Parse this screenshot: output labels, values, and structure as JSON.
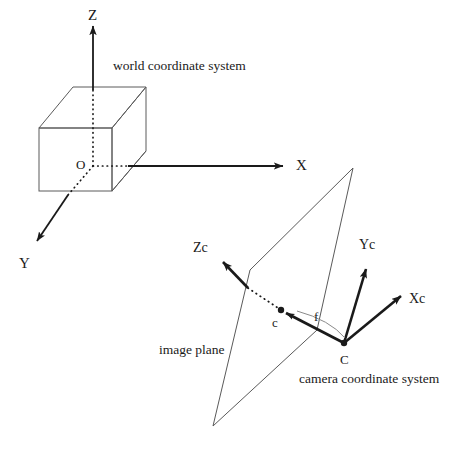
{
  "figure": {
    "background_color": "#ffffff",
    "stroke_color": "#1a1a1a",
    "thin_stroke_color": "#555555",
    "width": 450,
    "height": 450
  },
  "world": {
    "caption": "world coordinate system",
    "origin_label": "O",
    "axis_x_label": "X",
    "axis_y_label": "Y",
    "axis_z_label": "Z"
  },
  "camera": {
    "caption": "camera coordinate system",
    "center_label": "C",
    "principal_point_label": "c",
    "focal_label": "f",
    "axis_xc_label": "Xc",
    "axis_yc_label": "Yc",
    "axis_zc_label": "Zc"
  },
  "image_plane": {
    "caption": "image plane"
  },
  "geometry": {
    "cube": {
      "front_top_left": [
        39,
        128
      ],
      "front_top_right": [
        112,
        128
      ],
      "front_bottom_left": [
        39,
        191
      ],
      "front_bottom_right": [
        112,
        191
      ],
      "back_top_left": [
        73,
        87
      ],
      "back_top_right": [
        146,
        87
      ],
      "back_bottom_right": [
        146,
        151
      ],
      "back_bottom_left": [
        73,
        151
      ]
    },
    "origin_point": [
      93,
      166
    ],
    "axis_z_tip": [
      93,
      22
    ],
    "axis_x_tip": [
      288,
      166
    ],
    "axis_y_tip": [
      33,
      246
    ],
    "image_plane_quad": [
      [
        353,
        168
      ],
      [
        250,
        270
      ],
      [
        213,
        426
      ],
      [
        317,
        330
      ]
    ],
    "camera_center": [
      344,
      343
    ],
    "principal_point": [
      281,
      310
    ],
    "axis_zc_tip": [
      218,
      259
    ],
    "axis_yc_tip": [
      368,
      264
    ],
    "axis_xc_tip": [
      405,
      292
    ]
  }
}
